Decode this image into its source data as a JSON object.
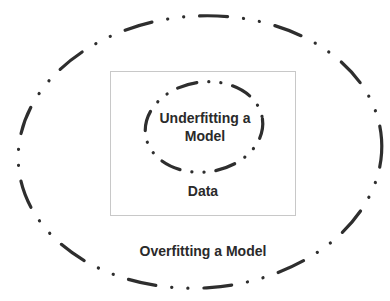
{
  "diagram": {
    "type": "nested-ellipses-venn",
    "outer_region": {
      "label": "Overfitting a Model",
      "style": "dash-dot-dot ellipse"
    },
    "data_box": {
      "label": "Data"
    },
    "inner_region": {
      "label_line1": "Underfitting a",
      "label_line2": "Model",
      "style": "dash-dot-dot ellipse"
    },
    "colors": {
      "stroke": "#2e2e2e",
      "text": "#2a2a2a",
      "box_border": "#c8c8c8",
      "background": "#ffffff"
    }
  }
}
